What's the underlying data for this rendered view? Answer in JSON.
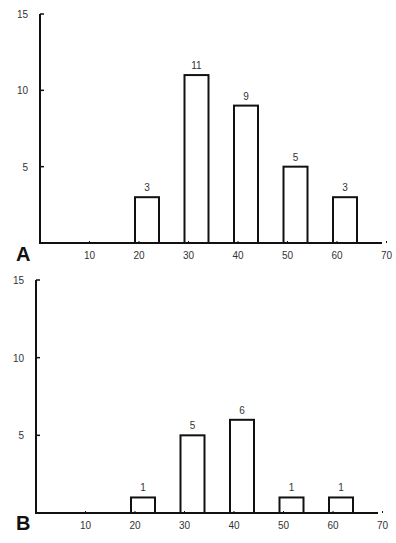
{
  "chart_data": [
    {
      "type": "bar",
      "panel_label": "A",
      "title": "",
      "xlabel": "",
      "ylabel": "",
      "categories": [
        "20",
        "30",
        "40",
        "50",
        "60"
      ],
      "x": [
        20,
        30,
        40,
        50,
        60
      ],
      "values": [
        3,
        11,
        9,
        5,
        3
      ],
      "data_labels": [
        "3",
        "11",
        "9",
        "5",
        "3"
      ],
      "x_ticks": [
        "10",
        "20",
        "30",
        "40",
        "50",
        "60",
        "70"
      ],
      "y_ticks": [
        "5",
        "10",
        "15"
      ],
      "xlim": [
        0,
        70
      ],
      "ylim": [
        0,
        15
      ],
      "grid": false,
      "legend": null,
      "bar_style": "outline-black"
    },
    {
      "type": "bar",
      "panel_label": "B",
      "title": "",
      "xlabel": "",
      "ylabel": "",
      "categories": [
        "20",
        "30",
        "40",
        "50",
        "60"
      ],
      "x": [
        20,
        30,
        40,
        50,
        60
      ],
      "values": [
        1,
        5,
        6,
        1,
        1
      ],
      "data_labels": [
        "1",
        "5",
        "6",
        "1",
        "1"
      ],
      "x_ticks": [
        "10",
        "20",
        "30",
        "40",
        "50",
        "60",
        "70"
      ],
      "y_ticks": [
        "5",
        "10",
        "15"
      ],
      "xlim": [
        0,
        70
      ],
      "ylim": [
        0,
        15
      ],
      "grid": false,
      "legend": null,
      "bar_style": "outline-black"
    }
  ],
  "panels": {
    "a": {
      "letter": "A"
    },
    "b": {
      "letter": "B"
    }
  },
  "colors": {
    "axis": "#111111",
    "bar_stroke": "#111111",
    "bar_fill": "#ffffff",
    "text": "#333333"
  }
}
